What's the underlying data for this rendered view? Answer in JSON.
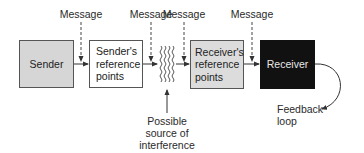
{
  "diagram": {
    "messages": [
      {
        "label": "Message",
        "x": 81
      },
      {
        "label": "Message",
        "x": 151
      },
      {
        "label": "Message",
        "x": 184
      },
      {
        "label": "Message",
        "x": 252
      }
    ],
    "boxes": {
      "sender": {
        "label": "Sender",
        "fill": "#d6d6d6",
        "text_color": "#222222"
      },
      "sender_ref": {
        "label": "Sender's reference points",
        "line1": "Sender's",
        "line2": "reference",
        "line3": "points",
        "fill": "#ffffff",
        "text_color": "#222222"
      },
      "receiver_ref": {
        "label": "Receiver's reference points",
        "line1": "Receiver's",
        "line2": "reference",
        "line3": "points",
        "fill": "#dcdcdc",
        "text_color": "#222222"
      },
      "receiver": {
        "label": "Receiver",
        "fill": "#111111",
        "text_color": "#e8e8e8"
      }
    },
    "interference": {
      "line1": "Possible",
      "line2": "source of",
      "line3": "interference"
    },
    "feedback": {
      "line1": "Feedback",
      "line2": "loop"
    }
  }
}
